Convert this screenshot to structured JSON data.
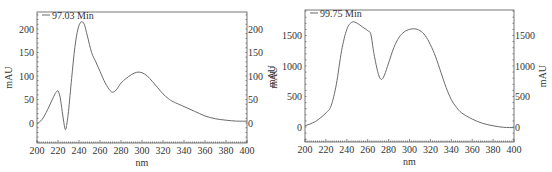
{
  "chart_data": [
    {
      "type": "line",
      "title": "",
      "legend": [
        "97.03 Min"
      ],
      "legend_position": "top-left",
      "xlabel": "nm",
      "ylabel": "mAU",
      "ylabel_right": "mAU",
      "xlim": [
        200,
        400
      ],
      "ylim": [
        -40,
        240
      ],
      "grid": false,
      "x_ticks": [
        200,
        220,
        240,
        260,
        280,
        300,
        320,
        340,
        360,
        380,
        400
      ],
      "y_ticks": [
        0,
        50,
        100,
        150,
        200
      ],
      "series": [
        {
          "name": "97.03 Min",
          "x": [
            200,
            205,
            210,
            215,
            218,
            220,
            222,
            224,
            226,
            227,
            228,
            230,
            233,
            236,
            239,
            242,
            245,
            248,
            252,
            256,
            260,
            265,
            270,
            273,
            276,
            280,
            285,
            290,
            295,
            300,
            305,
            310,
            315,
            320,
            325,
            330,
            340,
            350,
            360,
            370,
            380,
            390,
            400
          ],
          "y": [
            -2,
            8,
            28,
            52,
            65,
            68,
            55,
            25,
            -5,
            -14,
            -8,
            25,
            95,
            160,
            200,
            215,
            210,
            185,
            150,
            130,
            110,
            85,
            68,
            66,
            72,
            85,
            95,
            103,
            108,
            107,
            100,
            88,
            75,
            62,
            52,
            45,
            35,
            25,
            15,
            9,
            6,
            4,
            4
          ]
        }
      ],
      "frame": {
        "left": 37,
        "right": 247,
        "top": 12,
        "bottom": 143
      },
      "map": {
        "x0": 37,
        "xscale": 1.05,
        "y0": 123,
        "yscale": 0.47
      }
    },
    {
      "type": "line",
      "title": "",
      "legend": [
        "99.75 Min"
      ],
      "legend_position": "top-left",
      "xlabel": "nm",
      "ylabel": "mAU",
      "ylabel_right": "mAU",
      "xlim": [
        200,
        400
      ],
      "ylim": [
        -200,
        1950
      ],
      "grid": false,
      "x_ticks": [
        200,
        220,
        240,
        260,
        280,
        300,
        320,
        340,
        360,
        380,
        400
      ],
      "y_ticks": [
        0,
        500,
        1000,
        1500
      ],
      "series": [
        {
          "name": "99.75 Min",
          "x": [
            200,
            210,
            220,
            225,
            230,
            235,
            240,
            245,
            250,
            255,
            260,
            263,
            266,
            270,
            273,
            276,
            280,
            285,
            290,
            295,
            300,
            305,
            310,
            315,
            320,
            325,
            330,
            335,
            340,
            345,
            350,
            360,
            370,
            380,
            390,
            400
          ],
          "y": [
            20,
            90,
            230,
            350,
            700,
            1250,
            1600,
            1720,
            1700,
            1640,
            1580,
            1520,
            1200,
            880,
            780,
            850,
            1050,
            1300,
            1470,
            1560,
            1600,
            1610,
            1580,
            1500,
            1350,
            1150,
            900,
            650,
            450,
            320,
            230,
            130,
            60,
            20,
            -5,
            -10
          ]
        }
      ],
      "frame": {
        "left": 305,
        "right": 514,
        "top": 10,
        "bottom": 142
      },
      "map": {
        "x0": 305,
        "xscale": 1.045,
        "y0": 127,
        "yscale": 0.061
      }
    }
  ],
  "colors": {
    "curve": "#6a6a6a",
    "frame": "#555555",
    "text": "#333333"
  }
}
